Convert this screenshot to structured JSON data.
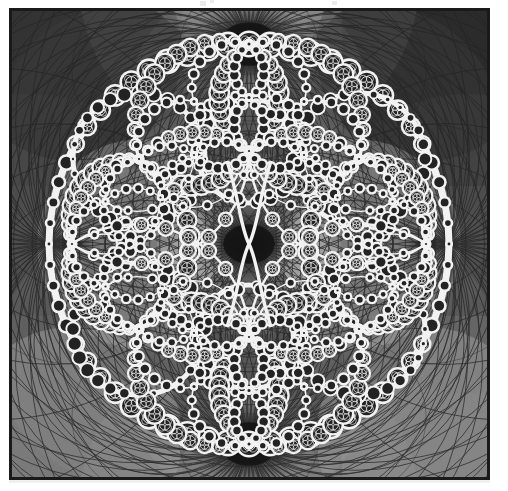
{
  "figure": {
    "type": "fractal-figure",
    "border_color": "#1a1a1a",
    "border_width_px": 3,
    "page_background": "#ffffff"
  },
  "canvas": {
    "width": 475,
    "height": 466,
    "background": "#3d3d3d",
    "center_x": 237,
    "center_y": 233
  },
  "palette": {
    "background": "#3d3d3d",
    "gray_darkest": "#2b2b2b",
    "gray_dark": "#3a3a3a",
    "gray_mid_dark": "#4a4a4a",
    "gray_mid": "#585858",
    "gray_mid_light": "#6b6b6b",
    "gray_light": "#828282",
    "gray_lighter": "#9b9b9b",
    "gray_lightest": "#b0b0b0",
    "limit_set": "#f2f2f2",
    "gasket_fill": "#232323",
    "circle_stroke": "#242424",
    "cusp_core": "#141414"
  },
  "structure": {
    "main_ring": {
      "center_x": 237,
      "center_y": 233,
      "radius": 200,
      "band_width": 7,
      "label": "outer limit circle"
    },
    "cusps": [
      {
        "name": "top-cusp",
        "x": 237,
        "y": 33,
        "intensity": 1.0
      },
      {
        "name": "bottom-cusp",
        "x": 237,
        "y": 433,
        "intensity": 1.0
      },
      {
        "name": "center-cusp",
        "x": 237,
        "y": 233,
        "intensity": 0.9
      }
    ],
    "inner_lobes": [
      {
        "name": "lobe-top-left",
        "cx": 127,
        "cy": 148,
        "r": 66
      },
      {
        "name": "lobe-top-right",
        "cx": 347,
        "cy": 148,
        "r": 66
      },
      {
        "name": "lobe-bottom-left",
        "cx": 127,
        "cy": 318,
        "r": 66
      },
      {
        "name": "lobe-bottom-right",
        "cx": 347,
        "cy": 318,
        "r": 66
      },
      {
        "name": "lobe-center-top",
        "cx": 237,
        "cy": 140,
        "r": 52
      },
      {
        "name": "lobe-center-bottom",
        "cx": 237,
        "cy": 326,
        "r": 52
      }
    ],
    "recursion_depth": 7,
    "tangent_circle_count_visible": 420
  },
  "shading": {
    "tile_regions": 16,
    "gradient_style": "radial-tangent-pencil",
    "diamond_highlights": [
      {
        "cx": 183,
        "cy": 243,
        "tone": "#a0a0a0"
      },
      {
        "cx": 292,
        "cy": 243,
        "tone": "#a0a0a0"
      }
    ]
  },
  "artifacts": {
    "top_marks": [
      {
        "name": "artifact-a",
        "x": 200,
        "y": 1
      },
      {
        "name": "artifact-b",
        "x": 210,
        "y": 0
      },
      {
        "name": "artifact-c",
        "x": 332,
        "y": 1
      }
    ]
  }
}
